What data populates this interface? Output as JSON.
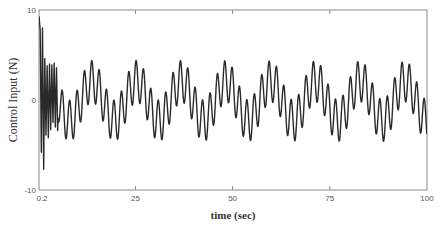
{
  "chart_data": {
    "type": "line",
    "title": "",
    "xlabel": "time (sec)",
    "ylabel": "Control Input (N)",
    "xlim": [
      0.2,
      100
    ],
    "ylim": [
      -10,
      10
    ],
    "xticks": [
      0.2,
      25,
      50,
      75,
      100
    ],
    "xtick_labels": [
      "0.2",
      "25",
      "50",
      "75",
      "100"
    ],
    "yticks": [
      -10,
      0,
      10
    ],
    "ytick_labels": [
      "-10",
      "0",
      "10"
    ],
    "grid": false,
    "legend": null,
    "line_color": "#2a2a2a",
    "series": [
      {
        "name": "Control Input",
        "description": "Initial transient up to ~9.3 N then sustained oscillation: slow sine (~11.5 s period, ~2.2 N) plus fast oscillation (~1.9 s period, ~2.3 N); envelope roughly +4.2 to -4.4 N",
        "model": {
          "slow_amp": 2.2,
          "slow_period": 11.5,
          "slow_phase": 0.3,
          "fast_amp": 2.3,
          "fast_period": 1.9,
          "fast_phase": 0.0,
          "transient_amp": 5.5,
          "transient_decay": 1.2,
          "transient_period": 0.9
        },
        "x": [
          0.2,
          0.5,
          0.8,
          1.1,
          1.4,
          1.7,
          2.0,
          2.3,
          2.6,
          2.9,
          3.2,
          3.5,
          3.8,
          4.1,
          4.4,
          4.7,
          5.0
        ],
        "y": [
          9.3,
          7.8,
          -5.8,
          8.0,
          -7.7,
          4.6,
          -3.9,
          3.8,
          -4.2,
          4.0,
          -3.3,
          3.9,
          -2.5,
          4.1,
          -3.0,
          3.6,
          -3.4
        ]
      }
    ]
  },
  "axes": {
    "x_label": "time (sec)",
    "y_label": "Control Input (N)",
    "x_ticks": [
      "0.2",
      "25",
      "50",
      "75",
      "100"
    ],
    "y_ticks": [
      "10",
      "0",
      "-10"
    ]
  }
}
